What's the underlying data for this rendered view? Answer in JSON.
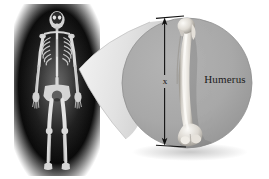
{
  "figure": {
    "background_color": "#ffffff"
  },
  "xray": {
    "name": "full-body-skeleton-xray",
    "description": "Anterior full-body skeletal radiograph on black background with radial glow",
    "background_color": "#000000",
    "bone_color": "#e8e8e8"
  },
  "callout": {
    "name": "magnified-circle",
    "fill_color": "#a8a8a8",
    "edge_color": "#8f8f8f",
    "cone_color": "#d8d8d8",
    "center_x": 187,
    "center_y": 83,
    "radius": 65
  },
  "bone": {
    "name": "humerus-bone",
    "label": "Humerus",
    "highlight_color": "#f2f0ec",
    "shade_color": "#9a968f"
  },
  "dimension": {
    "name": "length-dimension",
    "label": "x",
    "arrow_color": "#111111",
    "top_y": 20,
    "bottom_y": 142
  }
}
